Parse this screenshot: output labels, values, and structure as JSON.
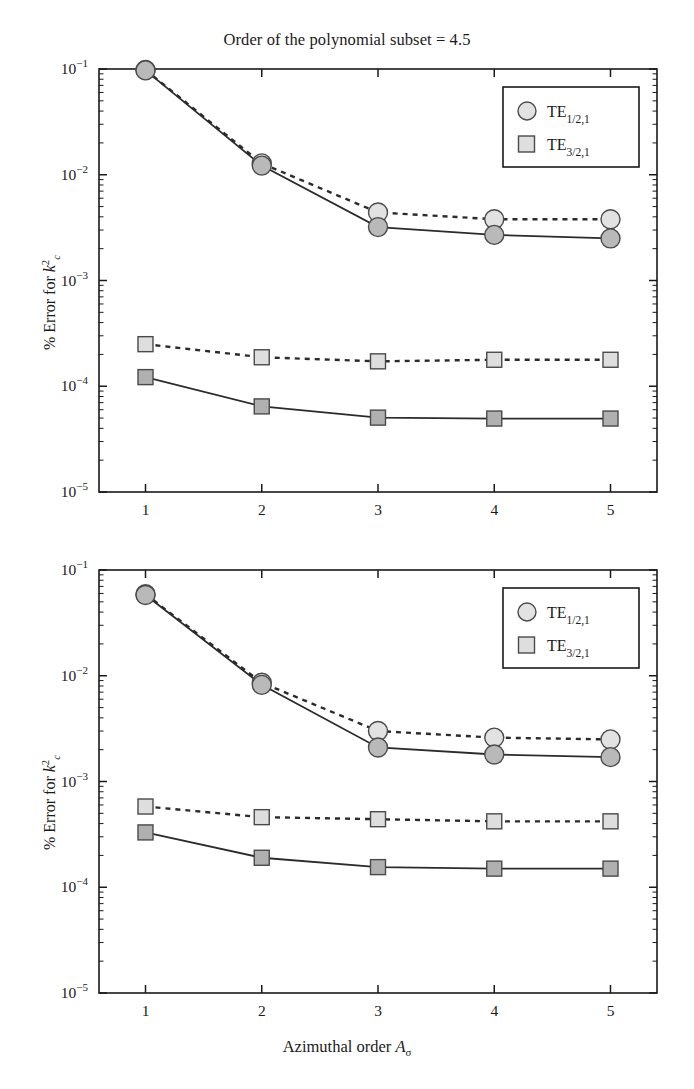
{
  "figure": {
    "title": "Order of the polynomial subset = 4.5",
    "xlabel_main": "Azimuthal order ",
    "xlabel_sym": "A",
    "xlabel_sub": "σ",
    "ylabel_main": "% Error for ",
    "ylabel_sym": "k",
    "ylabel_sup": "2",
    "ylabel_sub": "c",
    "legend": [
      {
        "label": "TE",
        "sub": "1/2,1",
        "marker": "circle"
      },
      {
        "label": "TE",
        "sub": "3/2,1",
        "marker": "square"
      }
    ],
    "colors": {
      "axis": "#1a1a1a",
      "line": "#2b2b2b",
      "circle_fill_light": "#e2e2e2",
      "circle_fill_dark": "#b9b9b9",
      "square_fill_light": "#dedede",
      "square_fill_dark": "#b0b0b0",
      "marker_edge": "#4a4a4a"
    }
  },
  "chart_data": [
    {
      "type": "line",
      "panel": "top",
      "title": "Order of the polynomial subset = 4.5",
      "xlabel": "Azimuthal order A_sigma",
      "ylabel": "% Error for k_c^2",
      "xticks": [
        "1",
        "2",
        "3",
        "4",
        "5"
      ],
      "x": [
        1,
        2,
        3,
        4,
        5
      ],
      "yticks": [
        "10^-1",
        "10^-2",
        "10^-3",
        "10^-4",
        "10^-5"
      ],
      "ylim": [
        1e-05,
        0.1
      ],
      "xlim": [
        0.6,
        5.4
      ],
      "yscale": "log",
      "grid": false,
      "legend_position": "upper right",
      "series": [
        {
          "name": "TE_1/2,1 dashed",
          "marker": "circle",
          "linestyle": "dashed",
          "values": [
            0.098,
            0.0128,
            0.0044,
            0.0038,
            0.0038
          ]
        },
        {
          "name": "TE_1/2,1 solid",
          "marker": "circle",
          "linestyle": "solid",
          "values": [
            0.097,
            0.0122,
            0.0032,
            0.0027,
            0.0025
          ]
        },
        {
          "name": "TE_3/2,1 dashed",
          "marker": "square",
          "linestyle": "dashed",
          "values": [
            0.00025,
            0.000188,
            0.000172,
            0.000178,
            0.000178
          ]
        },
        {
          "name": "TE_3/2,1 solid",
          "marker": "square",
          "linestyle": "solid",
          "values": [
            0.000122,
            6.45e-05,
            5.05e-05,
            4.95e-05,
            4.95e-05
          ]
        }
      ]
    },
    {
      "type": "line",
      "panel": "bottom",
      "title": "",
      "xlabel": "Azimuthal order A_sigma",
      "ylabel": "% Error for k_c^2",
      "xticks": [
        "1",
        "2",
        "3",
        "4",
        "5"
      ],
      "x": [
        1,
        2,
        3,
        4,
        5
      ],
      "yticks": [
        "10^-1",
        "10^-2",
        "10^-3",
        "10^-4",
        "10^-5"
      ],
      "ylim": [
        1e-05,
        0.1
      ],
      "xlim": [
        0.6,
        5.4
      ],
      "yscale": "log",
      "grid": false,
      "legend_position": "upper right",
      "series": [
        {
          "name": "TE_1/2,1 dashed",
          "marker": "circle",
          "linestyle": "dashed",
          "values": [
            0.059,
            0.0086,
            0.003,
            0.0026,
            0.0025
          ]
        },
        {
          "name": "TE_1/2,1 solid",
          "marker": "circle",
          "linestyle": "solid",
          "values": [
            0.058,
            0.0082,
            0.0021,
            0.0018,
            0.0017
          ]
        },
        {
          "name": "TE_3/2,1 dashed",
          "marker": "square",
          "linestyle": "dashed",
          "values": [
            0.00058,
            0.00046,
            0.00044,
            0.00042,
            0.00042
          ]
        },
        {
          "name": "TE_3/2,1 solid",
          "marker": "square",
          "linestyle": "solid",
          "values": [
            0.00033,
            0.00019,
            0.000155,
            0.00015,
            0.00015
          ]
        }
      ]
    }
  ]
}
